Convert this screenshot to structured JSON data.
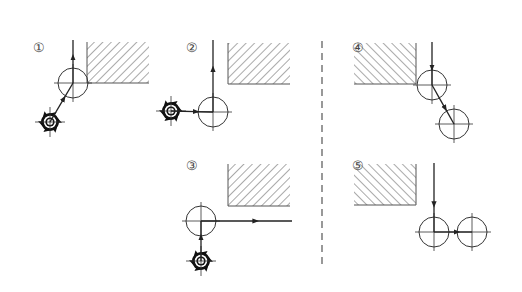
{
  "diagram": {
    "colors": {
      "line": "#333333",
      "hatch": "#555555",
      "tool": "#111111",
      "divider": "#555555"
    },
    "panels": [
      {
        "id": 1,
        "label": "①",
        "label_pos": [
          33,
          52
        ],
        "hatch": {
          "x": 87,
          "y": 42,
          "w": 62,
          "h": 41,
          "direction": "/"
        },
        "circles": [
          {
            "cx": 73,
            "cy": 83,
            "r": 15
          }
        ],
        "tool": {
          "cx": 50,
          "cy": 122
        },
        "paths": [
          {
            "from": [
              50,
              122
            ],
            "to": [
              73,
              83
            ]
          },
          {
            "from": [
              73,
              83
            ],
            "to": [
              73,
              40
            ]
          }
        ],
        "description": "Tool approaches diagonally, exits vertically upward"
      },
      {
        "id": 2,
        "label": "②",
        "label_pos": [
          186,
          52
        ],
        "hatch": {
          "x": 228,
          "y": 43,
          "w": 62,
          "h": 41,
          "direction": "/"
        },
        "circles": [
          {
            "cx": 213,
            "cy": 112,
            "r": 15
          }
        ],
        "tool": {
          "cx": 171,
          "cy": 111
        },
        "paths": [
          {
            "from": [
              171,
              111
            ],
            "to": [
              213,
              112
            ]
          },
          {
            "from": [
              213,
              112
            ],
            "to": [
              213,
              40
            ]
          }
        ],
        "description": "Tool approaches horizontally, exits vertically upward"
      },
      {
        "id": 3,
        "label": "③",
        "label_pos": [
          186,
          170
        ],
        "hatch": {
          "x": 228,
          "y": 164,
          "w": 62,
          "h": 42,
          "direction": "/"
        },
        "circles": [
          {
            "cx": 201,
            "cy": 221,
            "r": 15
          }
        ],
        "tool": {
          "cx": 201,
          "cy": 261
        },
        "paths": [
          {
            "from": [
              201,
              261
            ],
            "to": [
              201,
              221
            ]
          },
          {
            "from": [
              201,
              221
            ],
            "to": [
              292,
              221
            ]
          }
        ],
        "description": "Tool approaches vertically from below, exits horizontally right"
      },
      {
        "id": 4,
        "label": "④",
        "label_pos": [
          352,
          52
        ],
        "hatch": {
          "x": 354,
          "y": 43,
          "w": 62,
          "h": 41,
          "direction": "\\"
        },
        "circles": [
          {
            "cx": 432,
            "cy": 85,
            "r": 15
          },
          {
            "cx": 454,
            "cy": 124,
            "r": 15
          }
        ],
        "tool": null,
        "paths": [
          {
            "from": [
              432,
              42
            ],
            "to": [
              432,
              85
            ]
          },
          {
            "from": [
              432,
              85
            ],
            "to": [
              454,
              124
            ]
          }
        ],
        "description": "Tool enters vertically downward, exits diagonally"
      },
      {
        "id": 5,
        "label": "⑤",
        "label_pos": [
          352,
          170
        ],
        "hatch": {
          "x": 354,
          "y": 164,
          "w": 62,
          "h": 41,
          "direction": "\\"
        },
        "circles": [
          {
            "cx": 434,
            "cy": 232,
            "r": 15
          },
          {
            "cx": 472,
            "cy": 232,
            "r": 15
          }
        ],
        "tool": null,
        "paths": [
          {
            "from": [
              434,
              163
            ],
            "to": [
              434,
              232
            ]
          },
          {
            "from": [
              434,
              232
            ],
            "to": [
              472,
              232
            ]
          }
        ],
        "description": "Tool enters vertically downward, exits horizontally right"
      }
    ],
    "divider": {
      "x": 322,
      "y1": 41,
      "y2": 268,
      "style": "dashed"
    }
  }
}
